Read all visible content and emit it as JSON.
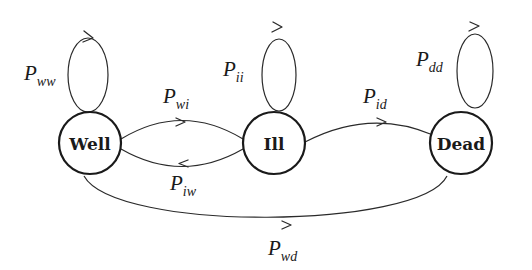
{
  "diagram": {
    "type": "state-transition",
    "colors": {
      "stroke": "#1a1a1a",
      "background": "#ffffff"
    },
    "nodes": [
      {
        "id": "well",
        "label": "Well",
        "cx": 90,
        "cy": 143,
        "r": 31
      },
      {
        "id": "ill",
        "label": "Ill",
        "cx": 274,
        "cy": 143,
        "r": 31
      },
      {
        "id": "dead",
        "label": "Dead",
        "cx": 461,
        "cy": 143,
        "r": 31
      }
    ],
    "edges": [
      {
        "id": "ww",
        "from": "Well",
        "to": "Well",
        "label_main": "P",
        "label_sub": "ww"
      },
      {
        "id": "ii",
        "from": "Ill",
        "to": "Ill",
        "label_main": "P",
        "label_sub": "ii"
      },
      {
        "id": "dd",
        "from": "Dead",
        "to": "Dead",
        "label_main": "P",
        "label_sub": "dd"
      },
      {
        "id": "wi",
        "from": "Well",
        "to": "Ill",
        "label_main": "P",
        "label_sub": "wi"
      },
      {
        "id": "iw",
        "from": "Ill",
        "to": "Well",
        "label_main": "P",
        "label_sub": "iw"
      },
      {
        "id": "id",
        "from": "Ill",
        "to": "Dead",
        "label_main": "P",
        "label_sub": "id"
      },
      {
        "id": "wd",
        "from": "Well",
        "to": "Dead",
        "label_main": "P",
        "label_sub": "wd"
      }
    ]
  }
}
